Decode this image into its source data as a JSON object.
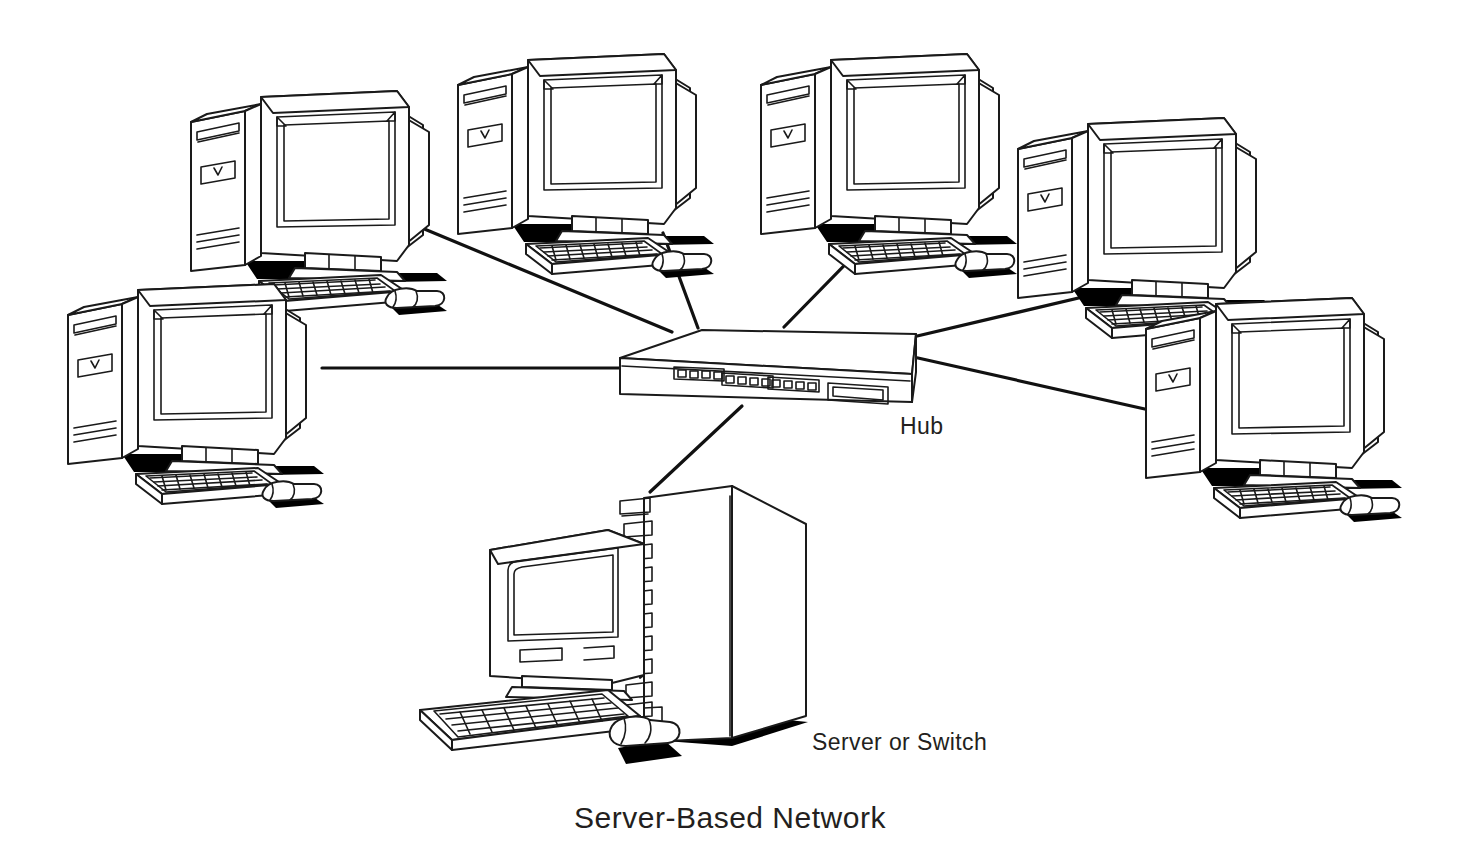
{
  "diagram": {
    "title": "Server-Based Network",
    "title_position": {
      "x": 730,
      "y": 826
    },
    "background_color": "#ffffff",
    "line_color": "#111111",
    "text_color": "#231f20",
    "type": "network-topology",
    "topology": "star",
    "labels": [
      {
        "id": "hub-label",
        "text": "Hub",
        "x": 900,
        "y": 434
      },
      {
        "id": "server-label",
        "text": "Server or Switch",
        "x": 812,
        "y": 750
      }
    ],
    "nodes": [
      {
        "id": "workstation-1",
        "kind": "workstation",
        "label": "",
        "x": 185,
        "y": 85,
        "scale": 1.0,
        "position": "top-left"
      },
      {
        "id": "workstation-2",
        "kind": "workstation",
        "label": "",
        "x": 452,
        "y": 48,
        "scale": 1.0,
        "position": "top-center-left"
      },
      {
        "id": "workstation-3",
        "kind": "workstation",
        "label": "",
        "x": 755,
        "y": 48,
        "scale": 1.0,
        "position": "top-center-right"
      },
      {
        "id": "workstation-4",
        "kind": "workstation",
        "label": "",
        "x": 1012,
        "y": 115,
        "scale": 1.0,
        "position": "top-right"
      },
      {
        "id": "workstation-5",
        "kind": "workstation",
        "label": "",
        "x": 60,
        "y": 278,
        "scale": 1.0,
        "position": "middle-left"
      },
      {
        "id": "workstation-6",
        "kind": "workstation",
        "label": "",
        "x": 1140,
        "y": 295,
        "scale": 1.0,
        "position": "middle-right"
      },
      {
        "id": "hub",
        "kind": "hub",
        "label": "Hub",
        "x": 620,
        "y": 330,
        "port_groups": 3,
        "ports_per_group": 4,
        "has_display_panel": true
      },
      {
        "id": "server",
        "kind": "server",
        "label": "Server or Switch",
        "x": 415,
        "y": 480,
        "drive_bays": 11
      }
    ],
    "connections": [
      {
        "id": "link-ws1-hub",
        "from": "workstation-1",
        "to": "hub",
        "from_point": [
          422,
          228
        ],
        "to_point": [
          672,
          330
        ]
      },
      {
        "id": "link-ws2-hub",
        "from": "workstation-2",
        "to": "hub",
        "from_point": [
          663,
          233
        ],
        "to_point": [
          697,
          326
        ]
      },
      {
        "id": "link-ws3-hub",
        "from": "workstation-3",
        "to": "hub",
        "from_point": [
          877,
          232
        ],
        "to_point": [
          782,
          325
        ]
      },
      {
        "id": "link-ws4-hub",
        "from": "workstation-4",
        "to": "hub",
        "from_point": [
          1100,
          290
        ],
        "to_point": [
          912,
          336
        ]
      },
      {
        "id": "link-ws5-hub",
        "from": "workstation-5",
        "to": "hub",
        "from_point": [
          322,
          368
        ],
        "to_point": [
          620,
          368
        ]
      },
      {
        "id": "link-ws6-hub",
        "from": "workstation-6",
        "to": "hub",
        "from_point": [
          1172,
          414
        ],
        "to_point": [
          918,
          356
        ]
      },
      {
        "id": "link-server-hub",
        "from": "server",
        "to": "hub",
        "from_point": [
          649,
          492
        ],
        "to_point": [
          740,
          404
        ]
      }
    ]
  }
}
